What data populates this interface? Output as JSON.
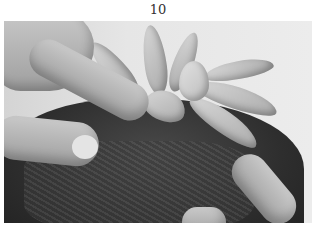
{
  "page": {
    "page_number": "10"
  },
  "photo": {
    "description": "Grayscale photo of hands planting a succulent rosette into moss-covered soil",
    "subjects": [
      "hand-left",
      "succulent-rosette",
      "moss-soil",
      "finger-right"
    ],
    "tone": "grayscale"
  }
}
